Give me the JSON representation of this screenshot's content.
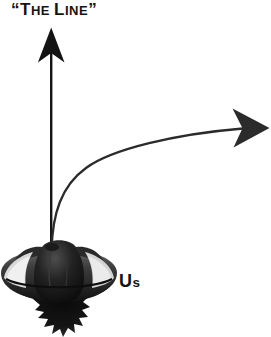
{
  "figure": {
    "title_label": {
      "full_text": "“THE LINE”",
      "open_quote": "“",
      "close_quote": "”",
      "word1_cap": "T",
      "word1_rest": "HE",
      "space": " ",
      "word2_cap": "L",
      "word2_rest": "INE"
    },
    "subject_label": {
      "full_text": "Us",
      "cap": "U",
      "rest": "s"
    },
    "colors": {
      "background": "#ffffff",
      "ink": "#141414",
      "curve": "#2b2b2b",
      "craft_dark": "#111111",
      "craft_mid": "#4a4a4a",
      "craft_light": "#d8d8d8",
      "craft_highlight": "#f2f2f2"
    },
    "elements": {
      "vertical_arrow_name": "straight-up-arrow",
      "curved_arrow_name": "curving-right-arrow",
      "craft_name": "flying-saucer"
    }
  }
}
